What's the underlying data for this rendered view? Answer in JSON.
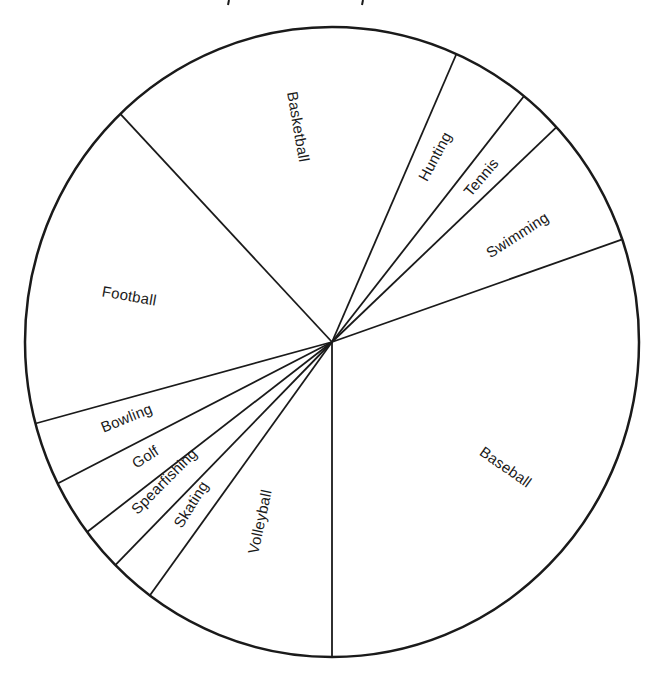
{
  "chart_data": {
    "type": "pie",
    "title": "",
    "start_angle_deg": 316.4,
    "direction": "clockwise",
    "center": [
      332,
      342
    ],
    "radius_x": 307,
    "radius_y": 315,
    "categories": [
      "Basketball",
      "Hunting",
      "Tennis",
      "Swimming",
      "Baseball",
      "Volleyball",
      "Skating",
      "Spearfishing",
      "Golf",
      "Bowling",
      "Football"
    ],
    "values": [
      19,
      4,
      2,
      7,
      30,
      10,
      2,
      2,
      3,
      3,
      17
    ],
    "unit": "percent (estimated from slice angles)",
    "slice_angles_deg": [
      67.5,
      14.8,
      8.3,
      24.0,
      109.0,
      36.4,
      8.5,
      8.0,
      10.4,
      11.7,
      61.4
    ],
    "legend": "none (labels inside slices)",
    "fill": "#ffffff",
    "stroke": "#1a1a1a"
  },
  "labels": [
    {
      "text": "Basketball",
      "x": 297,
      "y": 127,
      "rotate": 80
    },
    {
      "text": "Hunting",
      "x": 436,
      "y": 157,
      "rotate": -62
    },
    {
      "text": "Tennis",
      "x": 482,
      "y": 178,
      "rotate": -50
    },
    {
      "text": "Swimming",
      "x": 518,
      "y": 236,
      "rotate": -33
    },
    {
      "text": "Baseball",
      "x": 505,
      "y": 468,
      "rotate": 35
    },
    {
      "text": "Volleyball",
      "x": 261,
      "y": 522,
      "rotate": -78
    },
    {
      "text": "Skating",
      "x": 192,
      "y": 505,
      "rotate": -58
    },
    {
      "text": "Spearfishing",
      "x": 165,
      "y": 482,
      "rotate": -45
    },
    {
      "text": "Golf",
      "x": 146,
      "y": 458,
      "rotate": -33
    },
    {
      "text": "Bowling",
      "x": 127,
      "y": 419,
      "rotate": -22
    },
    {
      "text": "Football",
      "x": 129,
      "y": 297,
      "rotate": 10
    }
  ]
}
